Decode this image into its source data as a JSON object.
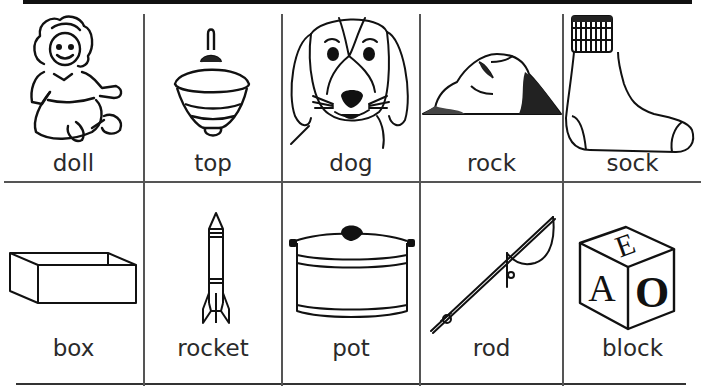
{
  "worksheet": {
    "rows": [
      {
        "cards": [
          {
            "word": "doll",
            "icon": "doll-icon"
          },
          {
            "word": "top",
            "icon": "spinning-top-icon"
          },
          {
            "word": "dog",
            "icon": "dog-icon"
          },
          {
            "word": "rock",
            "icon": "rock-icon"
          },
          {
            "word": "sock",
            "icon": "sock-icon"
          }
        ]
      },
      {
        "cards": [
          {
            "word": "box",
            "icon": "box-icon"
          },
          {
            "word": "rocket",
            "icon": "rocket-icon"
          },
          {
            "word": "pot",
            "icon": "pot-icon"
          },
          {
            "word": "rod",
            "icon": "fishing-rod-icon"
          },
          {
            "word": "block",
            "icon": "alphabet-block-icon"
          }
        ]
      }
    ],
    "block_letters": {
      "top": "E",
      "left": "A",
      "right": "O"
    }
  }
}
